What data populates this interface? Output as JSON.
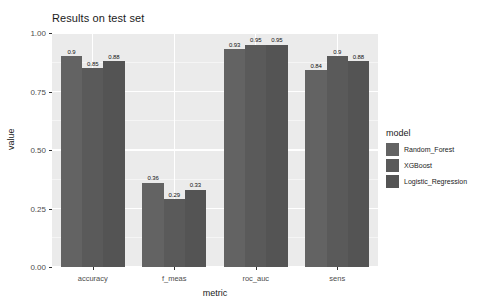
{
  "chart_data": {
    "type": "bar",
    "title": "Results on test set",
    "xlabel": "metric",
    "ylabel": "value",
    "categories": [
      "accuracy",
      "f_meas",
      "roc_auc",
      "sens"
    ],
    "series": [
      {
        "name": "Random_Forest",
        "values": [
          0.9,
          0.36,
          0.93,
          0.84
        ],
        "color": "#636363"
      },
      {
        "name": "XGBoost",
        "values": [
          0.85,
          0.29,
          0.95,
          0.9
        ],
        "color": "#5a5a5a"
      },
      {
        "name": "Logistic_Regression",
        "values": [
          0.88,
          0.33,
          0.95,
          0.88
        ],
        "color": "#545454"
      }
    ],
    "bar_labels": [
      [
        "0.9",
        "0.85",
        "0.88"
      ],
      [
        "0.36",
        "0.29",
        "0.33"
      ],
      [
        "0.93",
        "0.95",
        "0.95"
      ],
      [
        "0.84",
        "0.9",
        "0.88"
      ]
    ],
    "ylim": [
      0.0,
      1.0
    ],
    "yticks": [
      0.0,
      0.25,
      0.5,
      0.75,
      1.0
    ],
    "ytick_labels": [
      "0.00",
      "0.25",
      "0.50",
      "0.75",
      "1.00"
    ],
    "grid": true,
    "legend_title": "model",
    "legend_position": "right",
    "panel_background": "#ebebeb",
    "gridline_color": "#ffffff"
  }
}
